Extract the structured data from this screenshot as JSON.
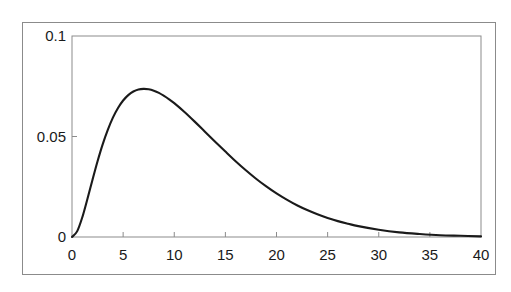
{
  "figure": {
    "cut_off_heading": "mnmn  nmnmn",
    "background_color": "#ffffff",
    "frame_color": "#8b8b8b",
    "line_color": "#1a1a1a"
  },
  "chart_data": {
    "type": "line",
    "title": "",
    "subtitle": "",
    "xlabel": "",
    "ylabel": "",
    "xlim": [
      0,
      40
    ],
    "ylim": [
      0,
      0.1
    ],
    "grid": false,
    "legend": null,
    "legend_position": "none",
    "xticks": [
      0,
      5,
      10,
      15,
      20,
      25,
      30,
      35,
      40
    ],
    "xtick_labels": [
      "0",
      "5",
      "10",
      "15",
      "20",
      "25",
      "30",
      "35",
      "40"
    ],
    "yticks": [
      0,
      0.05,
      0.1
    ],
    "ytick_labels": [
      "0",
      "0.05",
      "0.1"
    ],
    "series": [
      {
        "name": "density",
        "x": [
          0,
          0.5,
          1,
          1.5,
          2,
          2.5,
          3,
          3.5,
          4,
          4.5,
          5,
          5.5,
          6,
          6.5,
          7,
          7.5,
          8,
          8.5,
          9,
          9.5,
          10,
          11,
          12,
          13,
          14,
          15,
          16,
          17,
          18,
          19,
          20,
          21,
          22,
          23,
          24,
          25,
          26,
          27,
          28,
          30,
          32,
          34,
          36,
          38,
          40
        ],
        "y": [
          0.0,
          0.0028,
          0.0097,
          0.0188,
          0.0284,
          0.0377,
          0.0461,
          0.0533,
          0.0594,
          0.0642,
          0.0679,
          0.0706,
          0.0724,
          0.0734,
          0.0737,
          0.0735,
          0.0728,
          0.0717,
          0.0702,
          0.0685,
          0.0666,
          0.0622,
          0.0574,
          0.0524,
          0.0474,
          0.0425,
          0.0377,
          0.0332,
          0.029,
          0.0252,
          0.0217,
          0.0186,
          0.0158,
          0.0134,
          0.0113,
          0.0095,
          0.0079,
          0.0066,
          0.0054,
          0.0036,
          0.0023,
          0.0015,
          0.0009,
          0.0006,
          0.0003
        ],
        "peak_x": 8,
        "peak_y": 0.098,
        "half_max_left_x": 3.5,
        "half_max_right_x": 15.1
      }
    ]
  }
}
